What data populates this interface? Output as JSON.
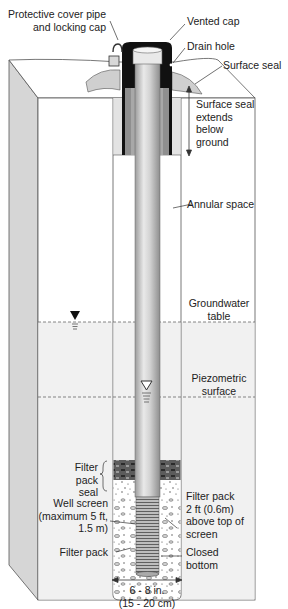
{
  "diagram": {
    "labels": {
      "protective_cover": "Protective cover pipe\nand locking cap",
      "vented_cap": "Vented cap",
      "drain_hole": "Drain hole",
      "surface_seal": "Surface seal",
      "surface_seal_extends": "Surface seal\nextends\nbelow\nground",
      "annular_space": "Annular space",
      "groundwater_table": "Groundwater\ntable",
      "piezometric_surface": "Piezometric\nsurface",
      "filter_pack_seal": "Filter\npack\nseal",
      "well_screen": "Well screen\n(maximum 5 ft,\n1.5 m)",
      "filter_pack_left": "Filter pack",
      "filter_pack_right": "Filter pack\n2 ft (0.6m)\nabove top of\nscreen",
      "closed_bottom": "Closed\nbottom",
      "diameter": "6 - 8 in.\n(15 - 20 cm)"
    },
    "symbols": {
      "water_table": "filled-triangle",
      "piezometric": "open-triangle"
    },
    "colors": {
      "side_face": "#d6d6d6",
      "front_face": "#ffffff",
      "saturated_zone": "#f1f1f1",
      "cap": "#111111",
      "seal": "#9a9a9a",
      "pipe": "#c8c8c8",
      "outline": "#555555"
    }
  }
}
